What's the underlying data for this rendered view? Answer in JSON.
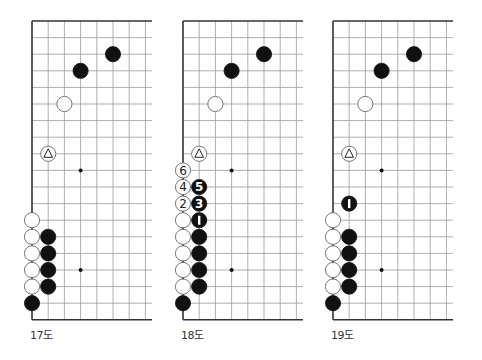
{
  "grid": {
    "origin_y": 21,
    "spacing_x": 16.2,
    "spacing_y": 16.6,
    "rows": 19,
    "visible_cols": 8,
    "right_extent": 120,
    "star_points": [
      [
        3,
        9
      ],
      [
        3,
        15
      ]
    ],
    "line_color": "#9a9a9a",
    "edge_color": "#333333"
  },
  "diagrams": [
    {
      "caption": "17도",
      "origin_x": 32,
      "stones": [
        {
          "color": "black",
          "col": 5,
          "row": 2
        },
        {
          "color": "black",
          "col": 3,
          "row": 3
        },
        {
          "color": "white",
          "col": 2,
          "row": 5
        },
        {
          "color": "white",
          "col": 1,
          "row": 8,
          "mark": "triangle"
        },
        {
          "color": "white",
          "col": 0,
          "row": 12
        },
        {
          "color": "white",
          "col": 0,
          "row": 13
        },
        {
          "color": "white",
          "col": 0,
          "row": 14
        },
        {
          "color": "white",
          "col": 0,
          "row": 15
        },
        {
          "color": "white",
          "col": 0,
          "row": 16
        },
        {
          "color": "black",
          "col": 1,
          "row": 13
        },
        {
          "color": "black",
          "col": 1,
          "row": 14
        },
        {
          "color": "black",
          "col": 1,
          "row": 15
        },
        {
          "color": "black",
          "col": 1,
          "row": 16
        },
        {
          "color": "black",
          "col": 0,
          "row": 17
        }
      ]
    },
    {
      "caption": "18도",
      "origin_x": 183,
      "stones": [
        {
          "color": "black",
          "col": 5,
          "row": 2
        },
        {
          "color": "black",
          "col": 3,
          "row": 3
        },
        {
          "color": "white",
          "col": 2,
          "row": 5
        },
        {
          "color": "white",
          "col": 1,
          "row": 8,
          "mark": "triangle"
        },
        {
          "color": "white",
          "col": 0,
          "row": 9,
          "label": "6"
        },
        {
          "color": "white",
          "col": 0,
          "row": 10,
          "label": "4"
        },
        {
          "color": "black",
          "col": 1,
          "row": 10,
          "label": "5"
        },
        {
          "color": "white",
          "col": 0,
          "row": 11,
          "label": "2"
        },
        {
          "color": "black",
          "col": 1,
          "row": 11,
          "label": "3"
        },
        {
          "color": "black",
          "col": 1,
          "row": 12,
          "label": "1"
        },
        {
          "color": "white",
          "col": 0,
          "row": 12
        },
        {
          "color": "white",
          "col": 0,
          "row": 13
        },
        {
          "color": "white",
          "col": 0,
          "row": 14
        },
        {
          "color": "white",
          "col": 0,
          "row": 15
        },
        {
          "color": "white",
          "col": 0,
          "row": 16
        },
        {
          "color": "black",
          "col": 1,
          "row": 13
        },
        {
          "color": "black",
          "col": 1,
          "row": 14
        },
        {
          "color": "black",
          "col": 1,
          "row": 15
        },
        {
          "color": "black",
          "col": 1,
          "row": 16
        },
        {
          "color": "black",
          "col": 0,
          "row": 17
        }
      ]
    },
    {
      "caption": "19도",
      "origin_x": 333,
      "stones": [
        {
          "color": "black",
          "col": 5,
          "row": 2
        },
        {
          "color": "black",
          "col": 3,
          "row": 3
        },
        {
          "color": "white",
          "col": 2,
          "row": 5
        },
        {
          "color": "white",
          "col": 1,
          "row": 8,
          "mark": "triangle"
        },
        {
          "color": "black",
          "col": 1,
          "row": 11,
          "label": "1"
        },
        {
          "color": "white",
          "col": 0,
          "row": 12
        },
        {
          "color": "white",
          "col": 0,
          "row": 13
        },
        {
          "color": "white",
          "col": 0,
          "row": 14
        },
        {
          "color": "white",
          "col": 0,
          "row": 15
        },
        {
          "color": "white",
          "col": 0,
          "row": 16
        },
        {
          "color": "black",
          "col": 1,
          "row": 13
        },
        {
          "color": "black",
          "col": 1,
          "row": 14
        },
        {
          "color": "black",
          "col": 1,
          "row": 15
        },
        {
          "color": "black",
          "col": 1,
          "row": 16
        },
        {
          "color": "black",
          "col": 0,
          "row": 17
        }
      ]
    }
  ]
}
